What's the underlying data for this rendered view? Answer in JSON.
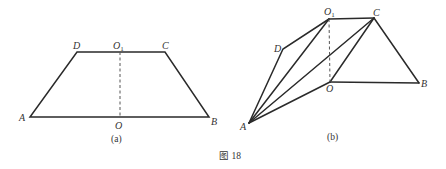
{
  "figure": {
    "caption": "图 18",
    "panels": [
      {
        "id": "a",
        "label": "(a)",
        "description": "Isosceles trapezoid ABCD with midline segment OO1 (dashed)",
        "points": {
          "A": [
            30,
            117
          ],
          "B": [
            209,
            117
          ],
          "C": [
            165,
            52
          ],
          "D": [
            77,
            52
          ],
          "O": [
            120,
            117
          ],
          "O1": [
            120,
            52
          ]
        },
        "vertex_labels": {
          "A": "A",
          "B": "B",
          "C": "C",
          "D": "D",
          "O": "O",
          "O1_main": "O",
          "O1_sub": "1"
        }
      },
      {
        "id": "b",
        "label": "(b)",
        "description": "Trapezoid folded along OO1; segments AO1, AC, AO, OC drawn",
        "points": {
          "A": [
            249,
            123
          ],
          "B": [
            419,
            83
          ],
          "C": [
            374,
            18
          ],
          "D": [
            283,
            49
          ],
          "O": [
            330,
            82
          ],
          "O1": [
            329,
            19
          ]
        },
        "vertex_labels": {
          "A": "A",
          "B": "B",
          "C": "C",
          "D": "D",
          "O": "O",
          "O1_main": "O",
          "O1_sub": "1"
        }
      }
    ]
  }
}
